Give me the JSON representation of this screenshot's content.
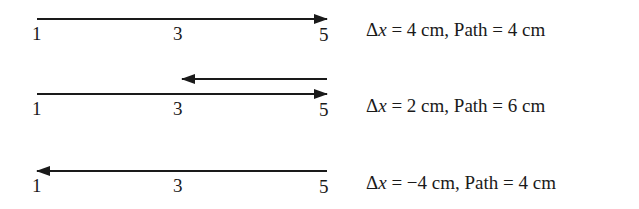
{
  "diagrams": [
    {
      "ticks": [
        "1",
        "3",
        "5"
      ],
      "caption": {
        "delta": "Δ",
        "var": "x",
        "eq": " = 4 cm, Path = 4 cm"
      },
      "arrows": [
        {
          "from": 1,
          "to": 5
        }
      ]
    },
    {
      "ticks": [
        "1",
        "3",
        "5"
      ],
      "caption": {
        "delta": "Δ",
        "var": "x",
        "eq": " = 2 cm, Path = 6 cm"
      },
      "arrows": [
        {
          "from": 1,
          "to": 5
        },
        {
          "from": 5,
          "to": 3
        }
      ]
    },
    {
      "ticks": [
        "1",
        "3",
        "5"
      ],
      "caption": {
        "delta": "Δ",
        "var": "x",
        "eq": " = −4 cm, Path = 4 cm"
      },
      "arrows": [
        {
          "from": 5,
          "to": 1
        }
      ]
    }
  ],
  "colors": {
    "ink": "#1a1a1a",
    "background": "#ffffff"
  }
}
